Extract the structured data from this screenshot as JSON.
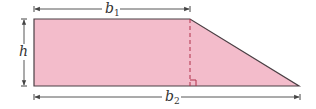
{
  "diagram": {
    "shape": "right trapezoid",
    "colors": {
      "fill": "#f3bccb",
      "outline": "#4a3f44",
      "altitude": "#b0304a",
      "dimension": "#444444",
      "background": "#ffffff"
    },
    "labels": {
      "b1": {
        "base": "b",
        "sub": "1"
      },
      "b2": {
        "base": "b",
        "sub": "2"
      },
      "h": {
        "base": "h"
      }
    },
    "geometry": {
      "top_left": [
        34,
        19
      ],
      "top_right": [
        190,
        19
      ],
      "bottom_right": [
        299,
        86
      ],
      "bottom_left": [
        34,
        86
      ]
    }
  }
}
